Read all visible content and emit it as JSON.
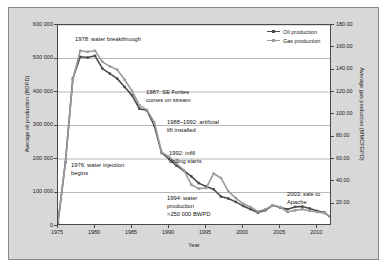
{
  "chart_data": {
    "type": "line",
    "title": "",
    "xlabel": "Year",
    "ylabel": "Average oil production (BOPD)",
    "y2label": "Average gas production (MMCFGPD)",
    "xlim": [
      1975,
      2012
    ],
    "ylim": [
      0,
      600000
    ],
    "y2lim": [
      0,
      180
    ],
    "xticks": [
      "1975",
      "1980",
      "1985",
      "1990",
      "1995",
      "2000",
      "2005",
      "2010"
    ],
    "yticks": [
      "0",
      "100000",
      "200000",
      "300000",
      "400000",
      "500000",
      "600000"
    ],
    "ytick_labels": [
      "0",
      "100 000",
      "200 000",
      "300 000",
      "400 000",
      "500 000",
      "600 000"
    ],
    "y2ticks": [
      "20.00",
      "40.00",
      "60.00",
      "80.00",
      "100.00",
      "120.00",
      "140.00",
      "160.00",
      "180.00"
    ],
    "grid": true,
    "legend_position": "top-right",
    "x": [
      1975,
      1976,
      1977,
      1978,
      1979,
      1980,
      1981,
      1982,
      1983,
      1984,
      1985,
      1986,
      1987,
      1988,
      1989,
      1990,
      1991,
      1992,
      1993,
      1994,
      1995,
      1996,
      1997,
      1998,
      1999,
      2000,
      2001,
      2002,
      2003,
      2004,
      2005,
      2006,
      2007,
      2008,
      2009,
      2010,
      2011,
      2012
    ],
    "series": [
      {
        "name": "Oil production",
        "color": "#4a4a4a",
        "axis": "left",
        "units": "BOPD",
        "values": [
          10000,
          190000,
          440000,
          505000,
          503000,
          508000,
          470000,
          455000,
          440000,
          415000,
          390000,
          350000,
          345000,
          300000,
          218000,
          200000,
          180000,
          165000,
          148000,
          128000,
          118000,
          110000,
          88000,
          82000,
          72000,
          60000,
          50000,
          40000,
          47000,
          62000,
          55000,
          50000,
          57000,
          58000,
          52000,
          45000,
          40000,
          22000
        ]
      },
      {
        "name": "Gas production",
        "color": "#9b9b9b",
        "axis": "right",
        "units": "MMCFGPD",
        "values": [
          3.3,
          57.0,
          131.0,
          157.0,
          156.0,
          157.0,
          147.0,
          143.0,
          140.0,
          131.0,
          121.0,
          108.0,
          104.0,
          93.0,
          66.0,
          62.0,
          56.0,
          50.0,
          37.0,
          33.5,
          34.0,
          47.0,
          43.0,
          31.0,
          25.0,
          20.0,
          17.0,
          13.0,
          15.0,
          18.5,
          17.0,
          12.5,
          14.0,
          15.0,
          13.5,
          12.5,
          11.5,
          7.5
        ]
      }
    ],
    "annotations": [
      {
        "id": "water-breakthrough",
        "text": "1978: water breakthrough"
      },
      {
        "id": "se-forties",
        "text": "1987: SE Forties\ncomes on stream"
      },
      {
        "id": "artificial-lift",
        "text": "1988–1992: artificial\nlift installed"
      },
      {
        "id": "infill-drilling",
        "text": "1992: infill\ndrilling starts"
      },
      {
        "id": "water-injection",
        "text": "1976: water injection\nbegins"
      },
      {
        "id": "water-production",
        "text": "1994: water\nproduction\n>250 000 BWPD"
      },
      {
        "id": "sale-to-apache",
        "text": "2003: sale to\nApache"
      }
    ]
  }
}
